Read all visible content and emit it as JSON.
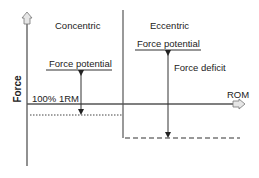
{
  "diagram": {
    "axes": {
      "y_label": "Force",
      "x_label": "ROM"
    },
    "regions": [
      {
        "title": "Concentric",
        "potential_label": "Force potential",
        "baseline_label": "100% 1RM",
        "baseline_style": "dotted"
      },
      {
        "title": "Eccentric",
        "potential_label": "Force potential",
        "deficit_label": "Force deficit",
        "baseline_style": "dashed"
      }
    ],
    "colors": {
      "line": "#333333",
      "arrow_fill": "#e0e0e0",
      "text": "#222222"
    }
  }
}
